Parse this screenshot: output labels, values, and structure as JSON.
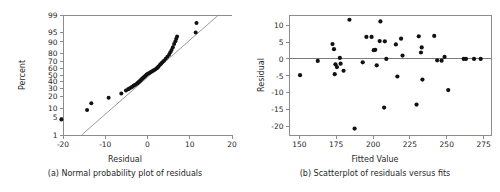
{
  "figure": {
    "background": "#ffffff",
    "point_color": "#111111",
    "axis_color": "#8c8c8c",
    "reference_line_color": "#9a9a9a"
  },
  "chart_data": [
    {
      "type": "scatter",
      "panel": "a",
      "title": "",
      "caption": "(a) Normal probability plot of residuals",
      "xlabel": "Residual",
      "ylabel": "Percent",
      "xlim": [
        -20,
        20
      ],
      "ylim": [
        1,
        99
      ],
      "yscale": "normal-probability",
      "grid": false,
      "legend": "none",
      "xticks": [
        -20,
        -10,
        0,
        10,
        20
      ],
      "xticklabels": [
        "-20",
        "-10",
        "0",
        "10",
        "20"
      ],
      "yticks": [
        1,
        5,
        10,
        20,
        30,
        40,
        50,
        60,
        70,
        80,
        90,
        95,
        99
      ],
      "yticklabels": [
        "1",
        "5",
        "10",
        "20",
        "30",
        "40",
        "50",
        "60",
        "70",
        "80",
        "90",
        "95",
        "99"
      ],
      "reference_line": {
        "label": "normal fit line",
        "x": [
          -15.6,
          16.8
        ],
        "y": [
          1,
          99
        ]
      },
      "x": [
        -20.4,
        -14.3,
        -13.3,
        -9.2,
        -6.2,
        -5.1,
        -4.6,
        -4.3,
        -3.9,
        -3.6,
        -3.3,
        -3.0,
        -2.7,
        -2.4,
        -2.2,
        -2.0,
        -1.8,
        -1.6,
        -1.4,
        -1.2,
        -1.0,
        -0.8,
        -0.6,
        -0.4,
        -0.2,
        0.1,
        0.4,
        0.7,
        1.0,
        1.3,
        1.6,
        1.9,
        2.2,
        2.4,
        2.6,
        2.9,
        3.2,
        3.5,
        3.9,
        4.3,
        4.7,
        5.1,
        5.4,
        5.7,
        6.0,
        6.3,
        6.6,
        6.8,
        7.0,
        11.4,
        11.6
      ],
      "y": [
        4.2,
        8.8,
        13.6,
        19.0,
        23.8,
        27.5,
        29.0,
        30.2,
        31.4,
        32.5,
        33.7,
        34.9,
        36.1,
        37.3,
        38.5,
        39.7,
        40.9,
        42.1,
        43.3,
        44.5,
        45.7,
        46.9,
        48.1,
        49.3,
        50.6,
        51.8,
        53.0,
        54.2,
        55.4,
        56.6,
        57.8,
        59.0,
        60.2,
        61.4,
        63.0,
        65.0,
        67.0,
        69.0,
        71.0,
        73.5,
        76.0,
        78.5,
        81.0,
        83.5,
        86.0,
        88.5,
        90.5,
        92.0,
        93.2,
        95.0,
        97.8
      ]
    },
    {
      "type": "scatter",
      "panel": "b",
      "title": "",
      "caption": "(b) Scatterplot of residuals versus fits",
      "xlabel": "Fitted Value",
      "ylabel": "Residual",
      "xlim": [
        143,
        280
      ],
      "ylim": [
        -22.5,
        13.0
      ],
      "grid": false,
      "legend": "none",
      "xticks": [
        150,
        175,
        200,
        225,
        250,
        275
      ],
      "xticklabels": [
        "150",
        "175",
        "200",
        "225",
        "250",
        "275"
      ],
      "yticks": [
        10,
        5,
        0,
        -5,
        -10,
        -15,
        -20
      ],
      "yticklabels": [
        "10",
        "5",
        "0",
        "-5",
        "-10",
        "-15",
        "-20"
      ],
      "zero_line": {
        "label": "y = 0 reference",
        "y": 0
      },
      "x": [
        150.5,
        162.5,
        172.5,
        173.5,
        174.5,
        174.0,
        175.5,
        177.5,
        178.0,
        180.0,
        184.0,
        187.5,
        193.0,
        195.5,
        199.0,
        200.5,
        201.5,
        202.5,
        204.5,
        205.0,
        207.5,
        208.0,
        209.0,
        215.5,
        216.5,
        219.0,
        220.0,
        229.5,
        231.0,
        232.5,
        233.5,
        233.0,
        241.5,
        243.5,
        246.5,
        248.5,
        251.0,
        261.5,
        263.0,
        268.5,
        273.0
      ],
      "y": [
        -4.8,
        -0.6,
        4.4,
        2.9,
        -1.6,
        -4.5,
        -2.4,
        0.3,
        -1.4,
        -3.5,
        11.6,
        -20.6,
        -1.0,
        6.5,
        6.5,
        2.6,
        2.7,
        -1.9,
        5.3,
        11.1,
        -14.4,
        5.2,
        0.0,
        4.3,
        -5.2,
        6.0,
        1.0,
        -13.5,
        6.7,
        1.9,
        -6.1,
        3.4,
        6.8,
        -0.4,
        -0.5,
        0.6,
        -9.2,
        0.0,
        0.0,
        0.0,
        0.0
      ]
    }
  ]
}
